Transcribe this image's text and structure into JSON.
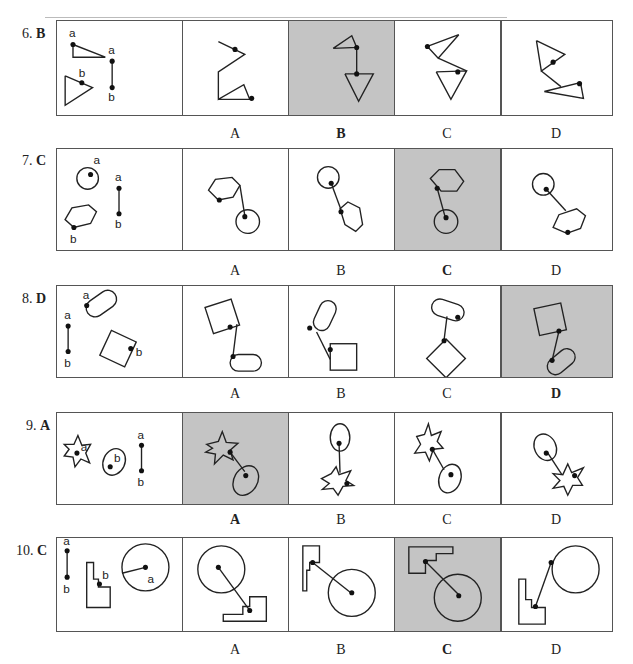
{
  "questions": [
    {
      "number": "6.",
      "answer": "B",
      "options": [
        "A",
        "B",
        "C",
        "D"
      ],
      "selected": "B",
      "prompt_labels": {
        "a1": "a",
        "a2": "a",
        "b1": "b",
        "b2": "b"
      }
    },
    {
      "number": "7.",
      "answer": "C",
      "options": [
        "A",
        "B",
        "C",
        "D"
      ],
      "selected": "C",
      "prompt_labels": {
        "a1": "a",
        "a2": "a",
        "b1": "b",
        "b2": "b"
      }
    },
    {
      "number": "8.",
      "answer": "D",
      "options": [
        "A",
        "B",
        "C",
        "D"
      ],
      "selected": "D",
      "prompt_labels": {
        "a1": "a",
        "a2": "a",
        "b1": "b",
        "b2": "b"
      }
    },
    {
      "number": "9.",
      "answer": "A",
      "options": [
        "A",
        "B",
        "C",
        "D"
      ],
      "selected": "A",
      "prompt_labels": {
        "a1": "a",
        "a2": "a",
        "b1": "b",
        "b2": "b"
      }
    },
    {
      "number": "10.",
      "answer": "C",
      "options": [
        "A",
        "B",
        "C",
        "D"
      ],
      "selected": "C",
      "prompt_labels": {
        "a1": "a",
        "a2": "a",
        "b1": "b",
        "b2": "b"
      }
    }
  ],
  "colors": {
    "selected_bg": "#c4c4c4",
    "border": "#555555",
    "stroke": "#222222"
  }
}
